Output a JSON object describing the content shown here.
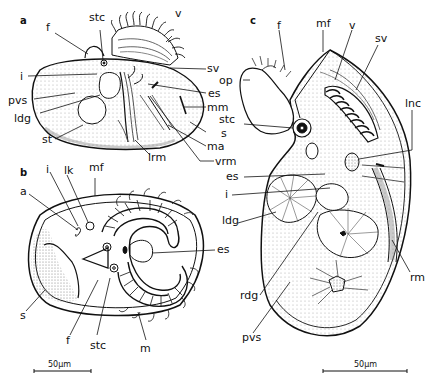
{
  "figure": {
    "panels": [
      {
        "id": "a",
        "label": "a",
        "labels": {
          "f": "f",
          "stc": "stc",
          "v": "v",
          "sv": "sv",
          "i": "i",
          "pvs": "pvs",
          "ldg": "ldg",
          "st": "st",
          "lrm": "lrm",
          "es": "es",
          "mm": "mm",
          "s": "s",
          "ma": "ma",
          "vrm": "vrm"
        }
      },
      {
        "id": "b",
        "label": "b",
        "labels": {
          "i": "i",
          "lk": "lk",
          "mf": "mf",
          "a": "a",
          "es": "es",
          "s": "s",
          "f": "f",
          "stc": "stc",
          "m": "m"
        },
        "scale_bar": "50µm"
      },
      {
        "id": "c",
        "label": "c",
        "labels": {
          "f": "f",
          "mf": "mf",
          "v": "v",
          "sv": "sv",
          "op": "op",
          "stc": "stc",
          "lnc": "lnc",
          "es": "es",
          "i": "i",
          "ldg": "ldg",
          "rdg": "rdg",
          "pvs": "pvs",
          "rm": "rm"
        },
        "scale_bar": "50µm"
      }
    ],
    "colors": {
      "ink": "#111111",
      "paper": "#ffffff",
      "stipple": "#bdbdbd"
    }
  }
}
